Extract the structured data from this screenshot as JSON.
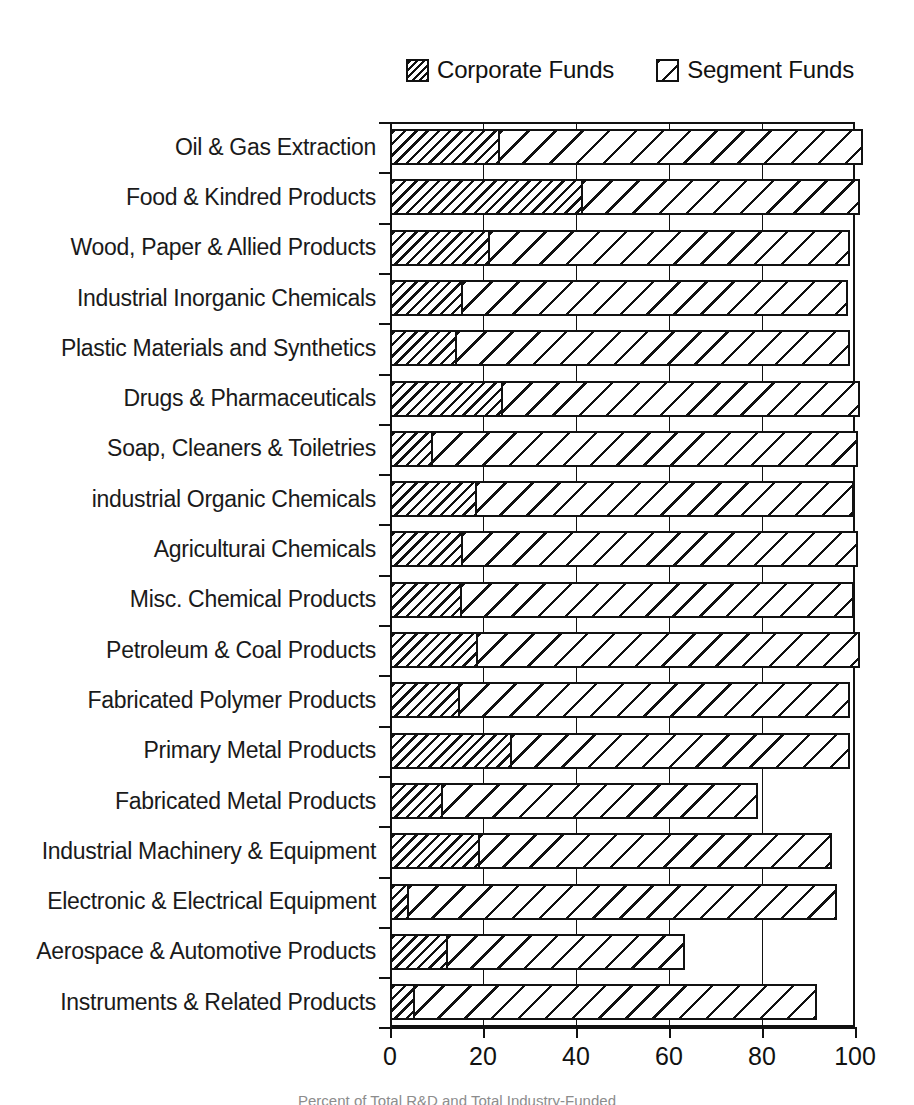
{
  "legend": {
    "entries": [
      {
        "label": "Corporate Funds",
        "swatch": "dense-hatch-swatch"
      },
      {
        "label": "Segment Funds",
        "swatch": "sparse-hatch-swatch"
      }
    ]
  },
  "axis": {
    "tick_labels": [
      "0",
      "20",
      "40",
      "60",
      "80",
      "100"
    ],
    "tick_values": [
      0,
      20,
      40,
      60,
      80,
      100
    ]
  },
  "caption": "Percent of Total R&D and Total Industry-Funded",
  "chart_data": {
    "type": "bar",
    "orientation": "horizontal",
    "stacked": true,
    "title": "",
    "xlabel": "",
    "ylabel": "",
    "xlim": [
      0,
      100
    ],
    "grid": true,
    "legend_position": "top-right",
    "categories": [
      "Oil & Gas Extraction",
      "Food & Kindred Products",
      "Wood, Paper & Allied Products",
      "Industrial Inorganic Chemicals",
      "Plastic Materials and Synthetics",
      "Drugs & Pharmaceuticals",
      "Soap, Cleaners & Toiletries",
      "industrial Organic Chemicals",
      "Agriculturai Chemicals",
      "Misc. Chemical Products",
      "Petroleum & Coal Products",
      "Fabricated Polymer Products",
      "Primary Metal Products",
      "Fabricated Metal Products",
      "Industrial Machinery & Equipment",
      "Electronic & Electrical Equipment",
      "Aerospace & Automotive Products",
      "Instruments & Related Products"
    ],
    "series": [
      {
        "name": "Corporate Funds",
        "values": [
          23.7,
          41.5,
          21.5,
          15.7,
          14.4,
          24.3,
          9.3,
          18.7,
          15.7,
          15.5,
          19.0,
          15.0,
          26.2,
          11.4,
          19.4,
          4.1,
          12.5,
          5.4
        ]
      },
      {
        "name": "Segment Funds",
        "values": [
          78.0,
          59.5,
          77.5,
          82.8,
          84.6,
          76.7,
          91.3,
          81.1,
          84.9,
          84.3,
          82.0,
          84.0,
          72.7,
          67.7,
          75.6,
          92.0,
          50.9,
          86.4
        ]
      }
    ],
    "totals": [
      101.7,
      101.0,
      99.0,
      98.5,
      99.0,
      101.0,
      100.6,
      99.8,
      100.6,
      99.8,
      101.0,
      99.0,
      98.9,
      79.1,
      95.0,
      96.1,
      63.4,
      91.8
    ]
  }
}
